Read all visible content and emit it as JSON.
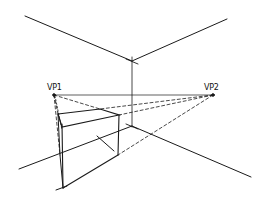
{
  "diagram": {
    "type": "two-point-perspective-sketch",
    "labels": {
      "vp1": "VP1",
      "vp2": "VP2"
    },
    "vanishing_points": {
      "vp1": [
        54,
        95
      ],
      "vp2": [
        213,
        95
      ]
    },
    "stroke_color": "#1a1a1a"
  }
}
